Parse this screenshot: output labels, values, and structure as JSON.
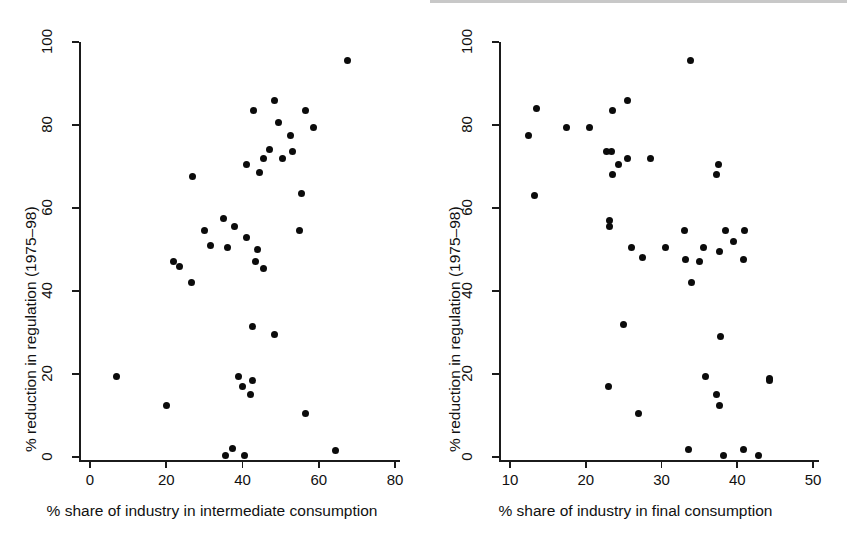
{
  "figure": {
    "background": "#ffffff",
    "point_color": "#0b0b0b",
    "axis_color": "#1b1b1b"
  },
  "panels": [
    {
      "id": "left",
      "xlabel": "% share of industry in intermediate consumption",
      "ylabel": "% reduction in regulation (1975–98)",
      "xticks": [
        "0",
        "20",
        "40",
        "60",
        "80"
      ],
      "yticks": [
        "0",
        "20",
        "40",
        "60",
        "80",
        "100"
      ]
    },
    {
      "id": "right",
      "xlabel": "% share of industry in final consumption",
      "ylabel": "% reduction in regulation (1975–98)",
      "xticks": [
        "10",
        "20",
        "30",
        "40",
        "50"
      ],
      "yticks": [
        "0",
        "20",
        "40",
        "60",
        "80",
        "100"
      ]
    }
  ],
  "chart_data": [
    {
      "type": "scatter",
      "title": "",
      "panel": "left",
      "xlabel": "% share of industry in intermediate consumption",
      "ylabel": "% reduction in regulation (1975–98)",
      "xlim": [
        0,
        80
      ],
      "ylim": [
        0,
        100
      ],
      "xticks": [
        0,
        20,
        40,
        60,
        80
      ],
      "yticks": [
        0,
        20,
        40,
        60,
        80,
        100
      ],
      "grid": false,
      "legend": "none",
      "points": [
        {
          "x": 67.5,
          "y": 95.5
        },
        {
          "x": 48.5,
          "y": 86.0
        },
        {
          "x": 43.0,
          "y": 83.5
        },
        {
          "x": 56.5,
          "y": 83.5
        },
        {
          "x": 49.5,
          "y": 80.5
        },
        {
          "x": 58.5,
          "y": 79.5
        },
        {
          "x": 52.5,
          "y": 77.5
        },
        {
          "x": 47.0,
          "y": 74.0
        },
        {
          "x": 53.0,
          "y": 73.5
        },
        {
          "x": 45.5,
          "y": 72.0
        },
        {
          "x": 50.5,
          "y": 72.0
        },
        {
          "x": 41.0,
          "y": 70.5
        },
        {
          "x": 44.5,
          "y": 68.5
        },
        {
          "x": 27.0,
          "y": 67.5
        },
        {
          "x": 55.5,
          "y": 63.5
        },
        {
          "x": 35.0,
          "y": 57.5
        },
        {
          "x": 38.0,
          "y": 55.5
        },
        {
          "x": 30.0,
          "y": 54.5
        },
        {
          "x": 55.0,
          "y": 54.5
        },
        {
          "x": 41.0,
          "y": 53.0
        },
        {
          "x": 31.5,
          "y": 51.0
        },
        {
          "x": 36.0,
          "y": 50.5
        },
        {
          "x": 44.0,
          "y": 50.0
        },
        {
          "x": 22.0,
          "y": 47.0
        },
        {
          "x": 43.5,
          "y": 47.0
        },
        {
          "x": 23.5,
          "y": 46.0
        },
        {
          "x": 45.5,
          "y": 45.5
        },
        {
          "x": 26.5,
          "y": 42.0
        },
        {
          "x": 42.5,
          "y": 31.5
        },
        {
          "x": 48.5,
          "y": 29.5
        },
        {
          "x": 7.0,
          "y": 19.5
        },
        {
          "x": 39.0,
          "y": 19.5
        },
        {
          "x": 42.5,
          "y": 18.5
        },
        {
          "x": 40.0,
          "y": 17.0
        },
        {
          "x": 42.0,
          "y": 15.0
        },
        {
          "x": 20.0,
          "y": 12.5
        },
        {
          "x": 56.5,
          "y": 10.5
        },
        {
          "x": 37.5,
          "y": 2.0
        },
        {
          "x": 64.5,
          "y": 1.5
        },
        {
          "x": 35.5,
          "y": 0.3
        },
        {
          "x": 40.5,
          "y": 0.3
        }
      ]
    },
    {
      "type": "scatter",
      "title": "",
      "panel": "right",
      "xlabel": "% share of industry in final consumption",
      "ylabel": "% reduction in regulation (1975–98)",
      "xlim": [
        10,
        50
      ],
      "ylim": [
        0,
        100
      ],
      "xticks": [
        10,
        20,
        30,
        40,
        50
      ],
      "yticks": [
        0,
        20,
        40,
        60,
        80,
        100
      ],
      "grid": false,
      "legend": "none",
      "points": [
        {
          "x": 33.8,
          "y": 95.5
        },
        {
          "x": 25.5,
          "y": 86.0
        },
        {
          "x": 13.5,
          "y": 84.0
        },
        {
          "x": 23.5,
          "y": 83.5
        },
        {
          "x": 17.5,
          "y": 79.5
        },
        {
          "x": 20.5,
          "y": 79.5
        },
        {
          "x": 12.5,
          "y": 77.5
        },
        {
          "x": 22.8,
          "y": 73.5
        },
        {
          "x": 23.4,
          "y": 73.5
        },
        {
          "x": 28.5,
          "y": 72.0
        },
        {
          "x": 25.5,
          "y": 72.0
        },
        {
          "x": 24.3,
          "y": 70.5
        },
        {
          "x": 37.5,
          "y": 70.5
        },
        {
          "x": 37.2,
          "y": 68.0
        },
        {
          "x": 23.5,
          "y": 68.0
        },
        {
          "x": 13.3,
          "y": 63.0
        },
        {
          "x": 23.2,
          "y": 57.0
        },
        {
          "x": 23.2,
          "y": 55.5
        },
        {
          "x": 33.0,
          "y": 54.5
        },
        {
          "x": 41.0,
          "y": 54.5
        },
        {
          "x": 38.5,
          "y": 54.5
        },
        {
          "x": 39.5,
          "y": 52.0
        },
        {
          "x": 26.0,
          "y": 50.5
        },
        {
          "x": 30.5,
          "y": 50.5
        },
        {
          "x": 35.5,
          "y": 50.5
        },
        {
          "x": 37.7,
          "y": 49.5
        },
        {
          "x": 27.5,
          "y": 48.0
        },
        {
          "x": 33.2,
          "y": 47.5
        },
        {
          "x": 40.8,
          "y": 47.5
        },
        {
          "x": 35.0,
          "y": 47.0
        },
        {
          "x": 34.0,
          "y": 42.0
        },
        {
          "x": 25.0,
          "y": 32.0
        },
        {
          "x": 37.8,
          "y": 29.0
        },
        {
          "x": 35.8,
          "y": 19.5
        },
        {
          "x": 44.3,
          "y": 19.0
        },
        {
          "x": 44.3,
          "y": 18.5
        },
        {
          "x": 23.0,
          "y": 17.0
        },
        {
          "x": 37.3,
          "y": 15.0
        },
        {
          "x": 37.6,
          "y": 12.5
        },
        {
          "x": 27.0,
          "y": 10.5
        },
        {
          "x": 33.5,
          "y": 1.8
        },
        {
          "x": 40.8,
          "y": 1.8
        },
        {
          "x": 38.2,
          "y": 0.3
        },
        {
          "x": 42.8,
          "y": 0.3
        }
      ]
    }
  ]
}
